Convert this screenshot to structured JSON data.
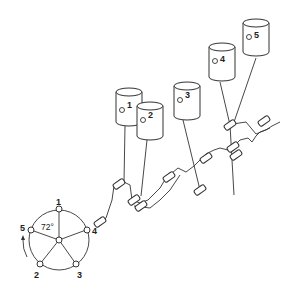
{
  "diagram": {
    "type": "firing-order-schematic",
    "cylinders": [
      {
        "label": "1",
        "cx": 129,
        "top": 90
      },
      {
        "label": "2",
        "cx": 150,
        "top": 104
      },
      {
        "label": "3",
        "cx": 186,
        "top": 86
      },
      {
        "label": "4",
        "cx": 222,
        "top": 46
      },
      {
        "label": "5",
        "cx": 256,
        "top": 22
      }
    ],
    "star": {
      "angle_label": "72°",
      "nodes": [
        "1",
        "4",
        "3",
        "2",
        "5"
      ],
      "rotation_arrow": "counterclockwise"
    }
  }
}
